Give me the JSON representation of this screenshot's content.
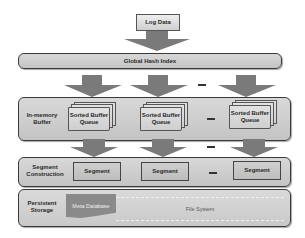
{
  "diagram": {
    "input": {
      "label": "Log Data"
    },
    "layers": {
      "global_hash_index": {
        "label": "Global Hash Index"
      },
      "in_memory_buffer": {
        "label_line1": "In-memory",
        "label_line2": "Buffer",
        "queues": [
          {
            "line1": "Sorted Buffer",
            "line2": "Queue"
          },
          {
            "line1": "Sorted Buffer",
            "line2": "Queue"
          },
          {
            "line1": "Sorted Buffer",
            "line2": "Queue"
          }
        ],
        "ellipsis": "—"
      },
      "segment_construction": {
        "label_line1": "Segment",
        "label_line2": "Construction",
        "segments": [
          "Segment",
          "Segment",
          "Segment"
        ],
        "ellipsis": "—"
      },
      "persistent_storage": {
        "label_line1": "Persistent",
        "label_line2": "Storage",
        "meta_database": "Meta Database",
        "file_system": "File System"
      }
    },
    "arrow_ellipsis": "—",
    "colors": {
      "arrow": "#7a7a7a",
      "layer_fill": "#cccccc",
      "meta_database": "#8a8a8a",
      "border": "#3a3a3a"
    }
  }
}
